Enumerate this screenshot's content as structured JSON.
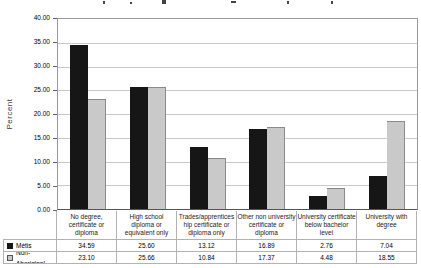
{
  "cropped_title_visible": true,
  "chart_data": {
    "type": "bar",
    "title": "",
    "xlabel": "",
    "ylabel": "Percent",
    "ylim": [
      0,
      40
    ],
    "ytick_step": 5,
    "y_tick_labels": [
      "0.00",
      "5.00",
      "10.00",
      "15.00",
      "20.00",
      "25.00",
      "30.00",
      "35.00",
      "40.00"
    ],
    "grid": true,
    "legend_position": "data-table-left-column",
    "categories": [
      "No degree, certificate or diploma",
      "High school diploma or equivalent only",
      "Trades/apprenticeship certificate or diploma only",
      "Other non university certificate or diploma",
      "University certificate below bachelor level",
      "University with degree"
    ],
    "category_label_lines": [
      [
        "No degree,",
        "certificate or",
        "diploma"
      ],
      [
        "High school",
        "diploma or",
        "equivalent only"
      ],
      [
        "Trades/apprentices",
        "hip certificate or",
        "diploma only"
      ],
      [
        "Other non university",
        "certificate or",
        "diploma"
      ],
      [
        "University certificate",
        "below bachelor",
        "level"
      ],
      [
        "University with",
        "degree"
      ]
    ],
    "series": [
      {
        "name": "Métis",
        "values": [
          34.59,
          25.6,
          13.12,
          16.89,
          2.76,
          7.04
        ],
        "color": "#161616",
        "swatch": "filled-black-square"
      },
      {
        "name": "Non-Aboriginal",
        "values": [
          23.1,
          25.66,
          10.84,
          17.37,
          4.48,
          18.55
        ],
        "color": "#c9c9c9",
        "swatch": "light-gray-square"
      }
    ],
    "value_format": "2dp",
    "data_table_shown": true
  },
  "colors": {
    "metis_bar": "#161616",
    "non_aboriginal_bar": "#c9c9c9",
    "gridline": "#c9c9c9",
    "plot_border": "#999999",
    "axis_line": "#555555",
    "table_border": "#b2b2b2",
    "text": "#000000"
  }
}
